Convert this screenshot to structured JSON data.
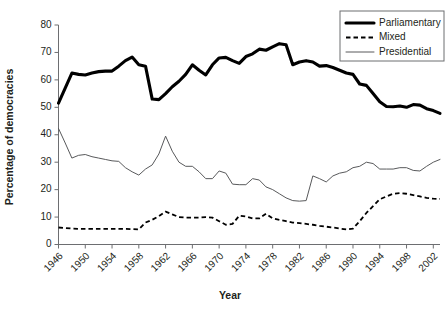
{
  "chart_data": {
    "type": "line",
    "title": "",
    "xlabel": "Year",
    "ylabel": "Percentage of democracies",
    "xlim": [
      1946,
      2003
    ],
    "ylim": [
      0,
      80
    ],
    "ytick_step": 10,
    "xtick_step": 4,
    "grid": false,
    "legend_position": "top-right",
    "ytick_labels": [
      "0",
      "10",
      "20",
      "30",
      "40",
      "50",
      "60",
      "70",
      "80"
    ],
    "xtick_labels": [
      "1946",
      "1950",
      "1954",
      "1958",
      "1962",
      "1966",
      "1970",
      "1974",
      "1978",
      "1982",
      "1986",
      "1990",
      "1994",
      "1998",
      "2002"
    ],
    "x": [
      1946,
      1947,
      1948,
      1949,
      1950,
      1951,
      1952,
      1953,
      1954,
      1955,
      1956,
      1957,
      1958,
      1959,
      1960,
      1961,
      1962,
      1963,
      1964,
      1965,
      1966,
      1967,
      1968,
      1969,
      1970,
      1971,
      1972,
      1973,
      1974,
      1975,
      1976,
      1977,
      1978,
      1979,
      1980,
      1981,
      1982,
      1983,
      1984,
      1985,
      1986,
      1987,
      1988,
      1989,
      1990,
      1991,
      1992,
      1993,
      1994,
      1995,
      1996,
      1997,
      1998,
      1999,
      2000,
      2001,
      2002,
      2003
    ],
    "series": [
      {
        "name": "Parliamentary",
        "style": "thick-solid",
        "color": "#000000",
        "values": [
          51.5,
          57.0,
          62.5,
          62.0,
          61.8,
          62.5,
          63.0,
          63.2,
          63.2,
          65.0,
          67.0,
          68.3,
          65.5,
          65.0,
          53.0,
          52.8,
          55.0,
          57.5,
          59.5,
          62.0,
          65.5,
          63.5,
          61.8,
          65.5,
          68.0,
          68.2,
          67.0,
          66.0,
          68.5,
          69.5,
          71.2,
          70.8,
          72.0,
          73.2,
          72.8,
          65.5,
          66.5,
          67.0,
          66.5,
          65.0,
          65.2,
          64.5,
          63.5,
          62.5,
          62.0,
          58.5,
          58.0,
          55.0,
          52.0,
          50.3,
          50.2,
          50.5,
          50.0,
          51.0,
          50.8,
          49.5,
          48.8,
          47.8
        ]
      },
      {
        "name": "Mixed",
        "style": "dashed",
        "color": "#000000",
        "values": [
          6.2,
          6.0,
          5.8,
          5.7,
          5.7,
          5.7,
          5.7,
          5.7,
          5.7,
          5.7,
          5.7,
          5.6,
          5.5,
          8.0,
          9.0,
          10.3,
          12.0,
          11.0,
          10.0,
          9.8,
          9.8,
          9.8,
          10.0,
          9.8,
          8.5,
          7.2,
          7.5,
          10.5,
          10.2,
          9.5,
          9.5,
          11.2,
          9.5,
          9.0,
          8.5,
          8.0,
          7.8,
          7.5,
          7.2,
          6.8,
          6.5,
          6.2,
          5.8,
          5.5,
          5.8,
          8.5,
          11.5,
          14.0,
          16.5,
          17.5,
          18.5,
          18.7,
          18.5,
          18.0,
          17.5,
          17.0,
          16.7,
          16.6
        ]
      },
      {
        "name": "Presidential",
        "style": "thin-solid",
        "color": "#58595b",
        "values": [
          42.3,
          37.0,
          31.5,
          32.5,
          32.8,
          32.0,
          31.5,
          31.0,
          30.5,
          30.3,
          28.0,
          26.5,
          25.3,
          27.5,
          29.0,
          33.0,
          39.5,
          34.0,
          30.0,
          28.5,
          28.5,
          26.5,
          24.0,
          24.0,
          26.8,
          26.0,
          22.0,
          21.8,
          21.8,
          24.0,
          23.5,
          21.0,
          20.0,
          18.5,
          17.0,
          16.0,
          15.8,
          16.0,
          25.0,
          24.0,
          22.8,
          25.0,
          26.0,
          26.5,
          28.0,
          28.5,
          30.0,
          29.5,
          27.5,
          27.5,
          27.5,
          28.0,
          28.0,
          27.0,
          26.8,
          28.5,
          30.0,
          31.0
        ]
      }
    ]
  },
  "legend": {
    "items": [
      {
        "label": "Parliamentary",
        "marker": "thick-solid-line-swatch"
      },
      {
        "label": "Mixed",
        "marker": "dashed-line-swatch"
      },
      {
        "label": "Presidential",
        "marker": "thin-solid-line-swatch"
      }
    ]
  }
}
